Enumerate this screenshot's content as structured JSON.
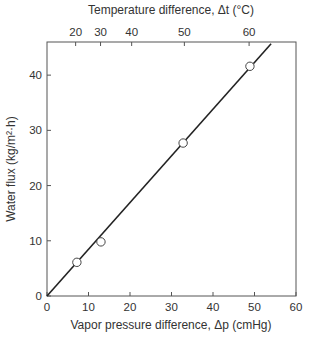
{
  "chart_data": {
    "type": "scatter",
    "title": "",
    "xlabel": "Vapor pressure difference, Δp (cmHg)",
    "ylabel": "Water flux (kg/m²·h)",
    "x2label": "Temperature difference, Δt (°C)",
    "xlim": [
      0,
      60
    ],
    "ylim": [
      0,
      46
    ],
    "x_ticks": [
      0,
      10,
      20,
      30,
      40,
      50,
      60
    ],
    "y_ticks": [
      0,
      10,
      20,
      30,
      40
    ],
    "x2_ticks": [
      {
        "label": "20",
        "dp": 6.9
      },
      {
        "label": "30",
        "dp": 12.9
      },
      {
        "label": "40",
        "dp": 20.4
      },
      {
        "label": "50",
        "dp": 33.1
      },
      {
        "label": "60",
        "dp": 48.7
      }
    ],
    "grid": false,
    "legend": null,
    "series": [
      {
        "name": "Measured",
        "marker": "open-circle",
        "x": [
          7.2,
          13.0,
          32.8,
          48.9
        ],
        "y": [
          6.1,
          9.8,
          27.7,
          41.6
        ]
      },
      {
        "name": "Linear fit",
        "style": "line",
        "x": [
          0,
          54.0
        ],
        "y": [
          0,
          45.7
        ]
      }
    ]
  }
}
